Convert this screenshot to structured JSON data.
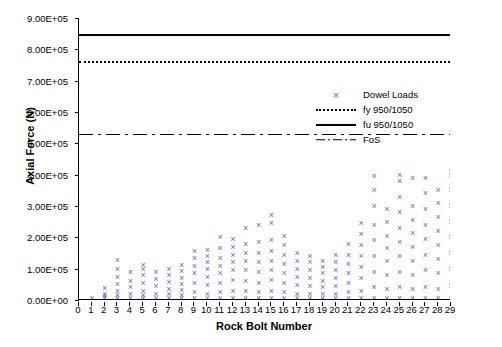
{
  "chart_data": {
    "type": "scatter",
    "title": "",
    "xlabel": "Rock Bolt Number",
    "ylabel": "Axial Force (N)",
    "xlim": [
      0,
      29
    ],
    "ylim": [
      0,
      900000
    ],
    "ytick_labels": [
      "0.00E+00",
      "1.00E+05",
      "2.00E+05",
      "3.00E+05",
      "4.00E+05",
      "5.00E+05",
      "6.00E+05",
      "7.00E+05",
      "8.00E+05",
      "9.00E+05"
    ],
    "ytick_values": [
      0,
      100000,
      200000,
      300000,
      400000,
      500000,
      600000,
      700000,
      800000,
      900000
    ],
    "xtick_labels": [
      "0",
      "1",
      "2",
      "3",
      "4",
      "5",
      "6",
      "7",
      "8",
      "9",
      "10",
      "11",
      "12",
      "13",
      "14",
      "15",
      "16",
      "17",
      "18",
      "19",
      "20",
      "21",
      "22",
      "23",
      "24",
      "25",
      "26",
      "27",
      "28",
      "29"
    ],
    "xtick_values": [
      0,
      1,
      2,
      3,
      4,
      5,
      6,
      7,
      8,
      9,
      10,
      11,
      12,
      13,
      14,
      15,
      16,
      17,
      18,
      19,
      20,
      21,
      22,
      23,
      24,
      25,
      26,
      27,
      28,
      29
    ],
    "grid": false,
    "legend_position": "inside-upper-right",
    "legend": [
      {
        "label": "Dowel Loads",
        "style": "marker-x",
        "color": "#6070b8"
      },
      {
        "label": "fy 950/1050",
        "style": "dotted-line",
        "color": "#000000"
      },
      {
        "label": "fu 950/1050",
        "style": "solid-line",
        "color": "#000000"
      },
      {
        "label": "FoS",
        "style": "dash-dot-line",
        "color": "#000000"
      }
    ],
    "reference_lines": [
      {
        "name": "fu 950/1050",
        "value": 850000,
        "style": "solid"
      },
      {
        "name": "fy 950/1050",
        "value": 762000,
        "style": "dotted"
      },
      {
        "name": "FoS",
        "value": 530000,
        "style": "dash-dot"
      }
    ],
    "series": [
      {
        "name": "Dowel Loads",
        "marker": "x",
        "color": "#6070b8",
        "points": [
          [
            1,
            5000
          ],
          [
            2,
            5000
          ],
          [
            2,
            12000
          ],
          [
            2,
            20000
          ],
          [
            2,
            38000
          ],
          [
            3,
            5000
          ],
          [
            3,
            15000
          ],
          [
            3,
            30000
          ],
          [
            3,
            52000
          ],
          [
            3,
            75000
          ],
          [
            3,
            100000
          ],
          [
            3,
            128000
          ],
          [
            4,
            5000
          ],
          [
            4,
            18000
          ],
          [
            4,
            40000
          ],
          [
            4,
            62000
          ],
          [
            4,
            88000
          ],
          [
            5,
            5000
          ],
          [
            5,
            15000
          ],
          [
            5,
            30000
          ],
          [
            5,
            55000
          ],
          [
            5,
            80000
          ],
          [
            5,
            100000
          ],
          [
            5,
            112000
          ],
          [
            6,
            5000
          ],
          [
            6,
            20000
          ],
          [
            6,
            45000
          ],
          [
            6,
            68000
          ],
          [
            6,
            90000
          ],
          [
            7,
            5000
          ],
          [
            7,
            18000
          ],
          [
            7,
            35000
          ],
          [
            7,
            58000
          ],
          [
            7,
            80000
          ],
          [
            7,
            98000
          ],
          [
            8,
            5000
          ],
          [
            8,
            15000
          ],
          [
            8,
            32000
          ],
          [
            8,
            50000
          ],
          [
            8,
            70000
          ],
          [
            8,
            92000
          ],
          [
            8,
            112000
          ],
          [
            9,
            5000
          ],
          [
            9,
            25000
          ],
          [
            9,
            55000
          ],
          [
            9,
            85000
          ],
          [
            9,
            110000
          ],
          [
            9,
            135000
          ],
          [
            9,
            155000
          ],
          [
            10,
            5000
          ],
          [
            10,
            20000
          ],
          [
            10,
            48000
          ],
          [
            10,
            75000
          ],
          [
            10,
            100000
          ],
          [
            10,
            120000
          ],
          [
            10,
            140000
          ],
          [
            10,
            160000
          ],
          [
            11,
            5000
          ],
          [
            11,
            25000
          ],
          [
            11,
            55000
          ],
          [
            11,
            85000
          ],
          [
            11,
            110000
          ],
          [
            11,
            135000
          ],
          [
            11,
            165000
          ],
          [
            11,
            200000
          ],
          [
            12,
            5000
          ],
          [
            12,
            30000
          ],
          [
            12,
            65000
          ],
          [
            12,
            95000
          ],
          [
            12,
            120000
          ],
          [
            12,
            145000
          ],
          [
            12,
            170000
          ],
          [
            12,
            195000
          ],
          [
            13,
            5000
          ],
          [
            13,
            30000
          ],
          [
            13,
            60000
          ],
          [
            13,
            95000
          ],
          [
            13,
            125000
          ],
          [
            13,
            150000
          ],
          [
            13,
            180000
          ],
          [
            13,
            230000
          ],
          [
            14,
            5000
          ],
          [
            14,
            25000
          ],
          [
            14,
            55000
          ],
          [
            14,
            90000
          ],
          [
            14,
            120000
          ],
          [
            14,
            150000
          ],
          [
            14,
            185000
          ],
          [
            14,
            240000
          ],
          [
            15,
            5000
          ],
          [
            15,
            30000
          ],
          [
            15,
            65000
          ],
          [
            15,
            95000
          ],
          [
            15,
            125000
          ],
          [
            15,
            155000
          ],
          [
            15,
            190000
          ],
          [
            15,
            245000
          ],
          [
            15,
            270000
          ],
          [
            16,
            5000
          ],
          [
            16,
            25000
          ],
          [
            16,
            55000
          ],
          [
            16,
            85000
          ],
          [
            16,
            115000
          ],
          [
            16,
            145000
          ],
          [
            16,
            175000
          ],
          [
            16,
            205000
          ],
          [
            17,
            5000
          ],
          [
            17,
            20000
          ],
          [
            17,
            48000
          ],
          [
            17,
            75000
          ],
          [
            17,
            100000
          ],
          [
            17,
            125000
          ],
          [
            17,
            150000
          ],
          [
            18,
            5000
          ],
          [
            18,
            20000
          ],
          [
            18,
            45000
          ],
          [
            18,
            70000
          ],
          [
            18,
            95000
          ],
          [
            18,
            120000
          ],
          [
            18,
            140000
          ],
          [
            19,
            5000
          ],
          [
            19,
            18000
          ],
          [
            19,
            40000
          ],
          [
            19,
            62000
          ],
          [
            19,
            85000
          ],
          [
            19,
            105000
          ],
          [
            19,
            125000
          ],
          [
            20,
            5000
          ],
          [
            20,
            20000
          ],
          [
            20,
            45000
          ],
          [
            20,
            70000
          ],
          [
            20,
            95000
          ],
          [
            20,
            120000
          ],
          [
            20,
            145000
          ],
          [
            21,
            5000
          ],
          [
            21,
            25000
          ],
          [
            21,
            55000
          ],
          [
            21,
            85000
          ],
          [
            21,
            115000
          ],
          [
            21,
            145000
          ],
          [
            21,
            180000
          ],
          [
            22,
            5000
          ],
          [
            22,
            30000
          ],
          [
            22,
            70000
          ],
          [
            22,
            105000
          ],
          [
            22,
            140000
          ],
          [
            22,
            175000
          ],
          [
            22,
            210000
          ],
          [
            22,
            245000
          ],
          [
            23,
            5000
          ],
          [
            23,
            40000
          ],
          [
            23,
            90000
          ],
          [
            23,
            140000
          ],
          [
            23,
            190000
          ],
          [
            23,
            240000
          ],
          [
            23,
            300000
          ],
          [
            23,
            350000
          ],
          [
            23,
            395000
          ],
          [
            24,
            5000
          ],
          [
            24,
            35000
          ],
          [
            24,
            80000
          ],
          [
            24,
            125000
          ],
          [
            24,
            165000
          ],
          [
            24,
            205000
          ],
          [
            24,
            250000
          ],
          [
            24,
            290000
          ],
          [
            25,
            5000
          ],
          [
            25,
            40000
          ],
          [
            25,
            90000
          ],
          [
            25,
            140000
          ],
          [
            25,
            185000
          ],
          [
            25,
            230000
          ],
          [
            25,
            280000
          ],
          [
            25,
            330000
          ],
          [
            25,
            380000
          ],
          [
            25,
            400000
          ],
          [
            26,
            5000
          ],
          [
            26,
            35000
          ],
          [
            26,
            80000
          ],
          [
            26,
            125000
          ],
          [
            26,
            170000
          ],
          [
            26,
            215000
          ],
          [
            26,
            255000
          ],
          [
            26,
            300000
          ],
          [
            26,
            390000
          ],
          [
            27,
            5000
          ],
          [
            27,
            40000
          ],
          [
            27,
            95000
          ],
          [
            27,
            145000
          ],
          [
            27,
            195000
          ],
          [
            27,
            240000
          ],
          [
            27,
            290000
          ],
          [
            27,
            340000
          ],
          [
            27,
            390000
          ],
          [
            28,
            5000
          ],
          [
            28,
            35000
          ],
          [
            28,
            85000
          ],
          [
            28,
            130000
          ],
          [
            28,
            175000
          ],
          [
            28,
            220000
          ],
          [
            28,
            265000
          ],
          [
            28,
            310000
          ],
          [
            28,
            350000
          ],
          [
            29,
            5000
          ],
          [
            29,
            45000
          ],
          [
            29,
            100000
          ],
          [
            29,
            150000
          ],
          [
            29,
            200000
          ],
          [
            29,
            250000
          ],
          [
            29,
            300000
          ],
          [
            29,
            350000
          ],
          [
            29,
            395000
          ],
          [
            29,
            412000
          ]
        ]
      }
    ]
  }
}
